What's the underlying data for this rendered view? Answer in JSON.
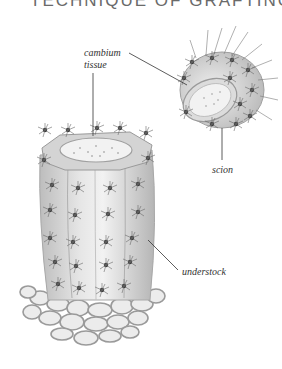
{
  "header": {
    "title_fragment": "TECHNIQUE OF GRAFTING"
  },
  "diagram": {
    "labels": {
      "cambium_line1": "cambium",
      "cambium_line2": "tissue",
      "scion": "scion",
      "understock": "understock"
    },
    "colors": {
      "ink": "#333333",
      "plant_fill": "#d9d9d9",
      "plant_shade": "#a8a8a8",
      "cut_surface": "#eeeeee",
      "spine": "#3a3a3a",
      "gravel": "#9a9a9a"
    }
  }
}
